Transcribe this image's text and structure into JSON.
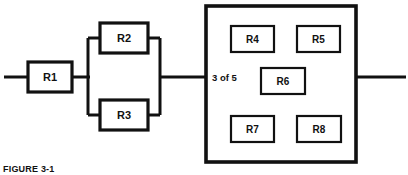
{
  "figure": {
    "caption": "FIGURE 3-1"
  },
  "diagram": {
    "type": "reliability-block-diagram",
    "background_color": "#ffffff",
    "line_color": "#111111",
    "series_blocks": [
      {
        "id": "R1",
        "label": "R1",
        "x": 28,
        "y": 62,
        "width": 44,
        "height": 30,
        "arrangement": "series"
      }
    ],
    "parallel_group": {
      "arrangement": "parallel",
      "left_rail_x": 88,
      "right_rail_x": 160,
      "top_y": 38,
      "bottom_y": 115,
      "blocks": [
        {
          "id": "R2",
          "label": "R2",
          "x": 100,
          "y": 23,
          "width": 48,
          "height": 30,
          "branch": "top"
        },
        {
          "id": "R3",
          "label": "R3",
          "x": 100,
          "y": 100,
          "width": 48,
          "height": 30,
          "branch": "bottom"
        }
      ]
    },
    "koon_group": {
      "arrangement": "k-out-of-n",
      "label": "3 of 5",
      "k": 3,
      "n": 5,
      "label_x": 212,
      "label_y": 77,
      "box": {
        "x": 206,
        "y": 6,
        "width": 150,
        "height": 156
      },
      "blocks": [
        {
          "id": "R4",
          "label": "R4",
          "x": 231,
          "y": 26,
          "width": 43,
          "height": 26
        },
        {
          "id": "R5",
          "label": "R5",
          "x": 297,
          "y": 26,
          "width": 43,
          "height": 26
        },
        {
          "id": "R6",
          "label": "R6",
          "x": 261,
          "y": 68,
          "width": 44,
          "height": 26
        },
        {
          "id": "R7",
          "label": "R7",
          "x": 231,
          "y": 116,
          "width": 43,
          "height": 26
        },
        {
          "id": "R8",
          "label": "R8",
          "x": 297,
          "y": 116,
          "width": 44,
          "height": 26
        }
      ]
    },
    "wires": {
      "main_line_y": 77,
      "input_lead": {
        "x1": 4,
        "y1": 77,
        "x2": 28,
        "y2": 77
      },
      "r1_to_parallel": {
        "x1": 72,
        "y1": 77,
        "x2": 88,
        "y2": 77
      },
      "parallel_to_koon": {
        "x1": 160,
        "y1": 77,
        "x2": 206,
        "y2": 77
      },
      "output_lead": {
        "x1": 356,
        "y1": 77,
        "x2": 406,
        "y2": 77
      }
    }
  }
}
